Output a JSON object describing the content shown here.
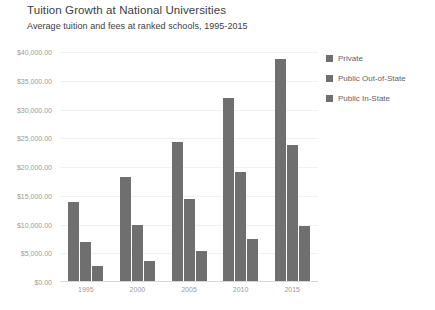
{
  "chart_data": {
    "type": "bar",
    "title": "Tuition Growth at National Universities",
    "subtitle": "Average tuition and fees at ranked schools, 1995-2015",
    "xlabel": "",
    "ylabel": "",
    "categories": [
      "1995",
      "2000",
      "2005",
      "2010",
      "2015"
    ],
    "series": [
      {
        "name": "Private",
        "values": [
          14000,
          18300,
          24300,
          32000,
          38800
        ]
      },
      {
        "name": "Public Out-of-State",
        "values": [
          7000,
          10000,
          14500,
          19200,
          23900
        ]
      },
      {
        "name": "Public In-State",
        "values": [
          2800,
          3600,
          5400,
          7400,
          9800
        ]
      }
    ],
    "ylim": [
      0,
      40000
    ],
    "ytick_values": [
      0,
      5000,
      10000,
      15000,
      20000,
      25000,
      30000,
      35000,
      40000
    ],
    "ytick_labels": [
      "$0.00",
      "$5,000.00",
      "$10,000.00",
      "$15,000.00",
      "$20,000.00",
      "$25,000.00",
      "$30,000.00",
      "$35,000.00",
      "$40,000.00"
    ],
    "grid": true,
    "legend_position": "right",
    "bar_color": "#6f6f6f",
    "gridline_color": "#f1f1f1",
    "axis_color": "#d8d8d8",
    "tick_label_color": "#9b9b9b",
    "title_color": "#3c4043",
    "legend_text_color": "#5f6368",
    "background_color": "#ffffff"
  }
}
